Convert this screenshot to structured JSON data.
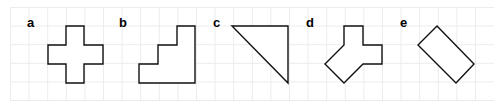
{
  "figure": {
    "width": 501,
    "height": 106,
    "grid": {
      "x0": 10.5,
      "y0": 7.5,
      "spacing": 18.6,
      "x_max": 494,
      "y_max": 101,
      "color": "#ececec"
    },
    "stroke_color": "#111111",
    "panels": [
      {
        "label": "a",
        "label_pos": [
          27,
          27
        ],
        "shape": "cross",
        "points": [
          [
            66,
            26
          ],
          [
            84,
            26
          ],
          [
            84,
            45
          ],
          [
            103,
            45
          ],
          [
            103,
            64
          ],
          [
            84,
            64
          ],
          [
            84,
            83
          ],
          [
            66,
            83
          ],
          [
            66,
            64
          ],
          [
            48,
            64
          ],
          [
            48,
            45
          ],
          [
            66,
            45
          ]
        ]
      },
      {
        "label": "b",
        "label_pos": [
          119,
          27
        ],
        "shape": "staircase",
        "points": [
          [
            177,
            26
          ],
          [
            195,
            26
          ],
          [
            195,
            83
          ],
          [
            139,
            83
          ],
          [
            139,
            64
          ],
          [
            158,
            64
          ],
          [
            158,
            45
          ],
          [
            177,
            45
          ]
        ]
      },
      {
        "label": "c",
        "label_pos": [
          213,
          27
        ],
        "shape": "right-triangle",
        "points": [
          [
            232,
            26
          ],
          [
            288,
            26
          ],
          [
            288,
            83
          ]
        ]
      },
      {
        "label": "d",
        "label_pos": [
          306,
          27
        ],
        "shape": "irregular-polygon",
        "points": [
          [
            344,
            26
          ],
          [
            363,
            26
          ],
          [
            363,
            45
          ],
          [
            382,
            45
          ],
          [
            382,
            64
          ],
          [
            363,
            64
          ],
          [
            344,
            83
          ],
          [
            325,
            64
          ],
          [
            344,
            45
          ]
        ]
      },
      {
        "label": "e",
        "label_pos": [
          400,
          27
        ],
        "shape": "rotated-rectangle",
        "points": [
          [
            437,
            26
          ],
          [
            474,
            64
          ],
          [
            456,
            83
          ],
          [
            418,
            45
          ]
        ]
      }
    ]
  }
}
